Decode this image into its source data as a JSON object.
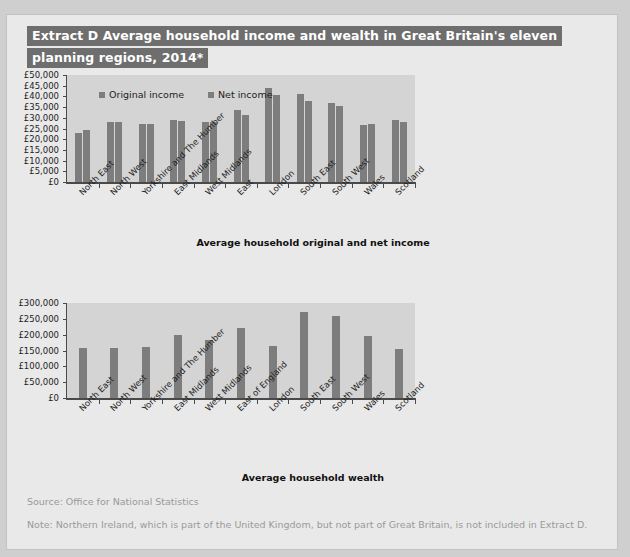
{
  "title": {
    "line1": "Extract D Average household income and wealth in Great Britain's eleven",
    "line2": "planning regions, 2014*"
  },
  "colors": {
    "page_bg": "#e9e9e9",
    "outer_bg": "#cfcfcf",
    "plot_bg": "#d4d4d4",
    "bar": "#7d7d7d",
    "title_bg": "#6e6e6e",
    "title_text": "#ffffff",
    "axis": "#4a4a4a",
    "footnote_text": "#9a9a9a"
  },
  "footer": {
    "source": "Source: Office for National Statistics",
    "note": "Note: Northern Ireland, which is part of the United Kingdom, but not part of Great Britain, is not included in Extract D."
  },
  "chart_data": [
    {
      "id": "income-chart",
      "type": "bar",
      "title": "Average household original and net income",
      "xlabel": "",
      "ylabel": "",
      "ylim": [
        0,
        50000
      ],
      "ytick_labels": [
        "£50,000",
        "£45,000",
        "£40,000",
        "£35,000",
        "£30,000",
        "£25,000",
        "£20,000",
        "£15,000",
        "£10,000",
        "£5,000",
        "£0"
      ],
      "ytick_values": [
        50000,
        45000,
        40000,
        35000,
        30000,
        25000,
        20000,
        15000,
        10000,
        5000,
        0
      ],
      "grid": false,
      "legend_position": "top-left",
      "categories": [
        "North East",
        "North West",
        "Yorkshire and The Humber",
        "East Midlands",
        "West Midlands",
        "East",
        "London",
        "South East",
        "South West",
        "Wales",
        "Scotland"
      ],
      "series": [
        {
          "name": "Original income",
          "values": [
            23000,
            28000,
            27000,
            29000,
            28000,
            33500,
            44000,
            41000,
            37000,
            26500,
            29000
          ]
        },
        {
          "name": "Net income",
          "values": [
            24500,
            28000,
            27000,
            28500,
            28000,
            31500,
            40500,
            38000,
            35500,
            27000,
            28000
          ]
        }
      ]
    },
    {
      "id": "wealth-chart",
      "type": "bar",
      "title": "Average household wealth",
      "xlabel": "",
      "ylabel": "",
      "ylim": [
        0,
        300000
      ],
      "ytick_labels": [
        "£300,000",
        "£250,000",
        "£200,000",
        "£150,000",
        "£100,000",
        "£50,000",
        "£0"
      ],
      "ytick_values": [
        300000,
        250000,
        200000,
        150000,
        100000,
        50000,
        0
      ],
      "grid": false,
      "legend_position": "none",
      "categories": [
        "North East",
        "North West",
        "Yorkshire and The Humber",
        "East Midlands",
        "West Midlands",
        "East of England",
        "London",
        "South East",
        "South West",
        "Wales",
        "Scotland"
      ],
      "series": [
        {
          "name": "Average household wealth",
          "values": [
            157000,
            158000,
            160000,
            198000,
            183000,
            220000,
            165000,
            272000,
            258000,
            195000,
            155000
          ]
        }
      ]
    }
  ]
}
